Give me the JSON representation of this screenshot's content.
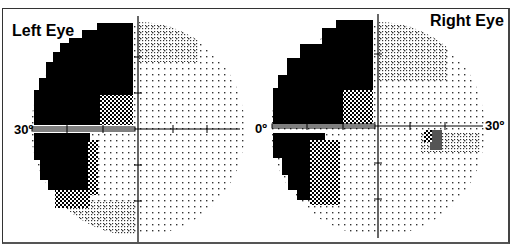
{
  "figure": {
    "panels": [
      {
        "title": "Left Eye",
        "left_label": "30º",
        "right_label": "3"
      },
      {
        "title": "Right Eye",
        "left_label": "0º",
        "right_label": "30º"
      }
    ]
  },
  "colors": {
    "defect": "#000000",
    "partial": "#444444",
    "background": "#ffffff",
    "axis": "#000000"
  }
}
